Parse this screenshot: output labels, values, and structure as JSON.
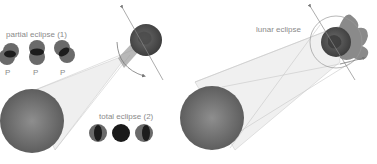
{
  "left_panel": {
    "partial_label": "partial eclipse (1)",
    "total_label": "total eclipse (2)",
    "p_labels": [
      "P",
      "P",
      "P"
    ]
  },
  "right_panel": {
    "lunar_label": "lunar eclipse"
  },
  "colors": {
    "sun": "#7a7a7a",
    "earth": "#5a5a5a",
    "moon_dark": "#222222",
    "beam": "#e8e8e8",
    "line": "#bbbbbb",
    "text": "#8a8a8a"
  }
}
